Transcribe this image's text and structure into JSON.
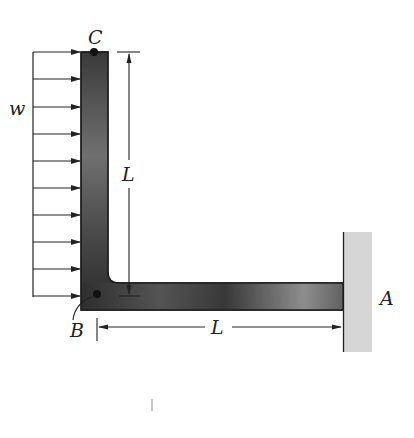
{
  "figure": {
    "type": "structural-mechanics-diagram",
    "labels": {
      "load": "w",
      "top_point": "C",
      "corner_point": "B",
      "support": "A",
      "vertical_length": "L",
      "horizontal_length": "L"
    },
    "load": {
      "name": "w",
      "kind": "uniform-distributed",
      "direction": "right",
      "arrow_count": 10
    },
    "colors": {
      "member_dark": "#3a3a3a",
      "member_light": "#9a9a9a",
      "wall": "#d8d8d8",
      "line": "#222222"
    }
  }
}
